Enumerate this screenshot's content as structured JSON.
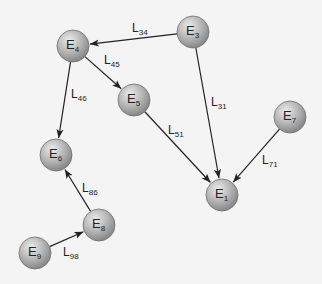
{
  "diagram": {
    "type": "directed-graph",
    "colors": {
      "background": "#f4f4f4",
      "node_light": "#e2e2e2",
      "node_dark": "#8f8f8f",
      "edge": "#222222"
    },
    "node_radius": 16,
    "nodes": [
      {
        "id": "E1",
        "base": "E",
        "sub": "1",
        "x": 222,
        "y": 195
      },
      {
        "id": "E3",
        "base": "E",
        "sub": "3",
        "x": 193,
        "y": 32
      },
      {
        "id": "E4",
        "base": "E",
        "sub": "4",
        "x": 73,
        "y": 46
      },
      {
        "id": "E5",
        "base": "E",
        "sub": "5",
        "x": 134,
        "y": 100
      },
      {
        "id": "E6",
        "base": "E",
        "sub": "6",
        "x": 56,
        "y": 155
      },
      {
        "id": "E7",
        "base": "E",
        "sub": "7",
        "x": 290,
        "y": 117
      },
      {
        "id": "E8",
        "base": "E",
        "sub": "8",
        "x": 99,
        "y": 225
      },
      {
        "id": "E9",
        "base": "E",
        "sub": "9",
        "x": 35,
        "y": 253
      }
    ],
    "edges": [
      {
        "id": "L34",
        "base": "L",
        "sub": "34",
        "from": "E3",
        "to": "E4",
        "lx": 132,
        "ly": 32
      },
      {
        "id": "L45",
        "base": "L",
        "sub": "45",
        "from": "E4",
        "to": "E5",
        "lx": 104,
        "ly": 64
      },
      {
        "id": "L46",
        "base": "L",
        "sub": "46",
        "from": "E4",
        "to": "E6",
        "lx": 71,
        "ly": 98
      },
      {
        "id": "L31",
        "base": "L",
        "sub": "31",
        "from": "E3",
        "to": "E1",
        "lx": 211,
        "ly": 106
      },
      {
        "id": "L51",
        "base": "L",
        "sub": "51",
        "from": "E5",
        "to": "E1",
        "lx": 168,
        "ly": 134
      },
      {
        "id": "L71",
        "base": "L",
        "sub": "71",
        "from": "E7",
        "to": "E1",
        "lx": 262,
        "ly": 164
      },
      {
        "id": "L86",
        "base": "L",
        "sub": "86",
        "from": "E8",
        "to": "E6",
        "lx": 82,
        "ly": 192
      },
      {
        "id": "L98",
        "base": "L",
        "sub": "98",
        "from": "E9",
        "to": "E8",
        "lx": 63,
        "ly": 256
      }
    ]
  }
}
